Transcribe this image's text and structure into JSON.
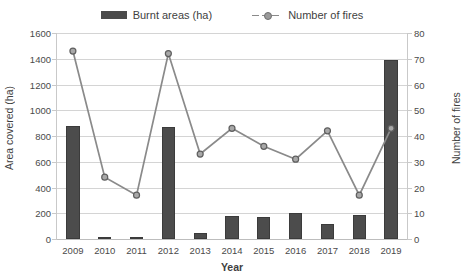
{
  "legend": {
    "items": [
      {
        "label": "Burnt areas (ha)",
        "type": "bar",
        "color": "#4c4c4c",
        "icon": "bar-swatch-icon"
      },
      {
        "label": "Number of fires",
        "type": "line",
        "color": "#8a8a8a",
        "icon": "line-marker-swatch-icon"
      }
    ]
  },
  "axes": {
    "left_title": "Area covered (ha)",
    "right_title": "Number of fires",
    "x_title": "Year",
    "left_ticks": [
      "0",
      "200",
      "400",
      "600",
      "800",
      "1000",
      "1200",
      "1400",
      "1600"
    ],
    "right_ticks": [
      "0",
      "10",
      "20",
      "30",
      "40",
      "50",
      "60",
      "70",
      "80"
    ],
    "x_ticks": [
      "2009",
      "2010",
      "2011",
      "2012",
      "2013",
      "2014",
      "2015",
      "2016",
      "2017",
      "2018",
      "2019"
    ]
  },
  "chart_data": {
    "type": "bar",
    "title": "",
    "subtitle": "",
    "xlabel": "Year",
    "ylabel": "Area covered (ha)",
    "y2label": "Number of fires",
    "categories": [
      "2009",
      "2010",
      "2011",
      "2012",
      "2013",
      "2014",
      "2015",
      "2016",
      "2017",
      "2018",
      "2019"
    ],
    "ylim": [
      0,
      1600
    ],
    "y2lim": [
      0,
      80
    ],
    "ytick_step": 200,
    "y2tick_step": 10,
    "grid": true,
    "legend_position": "top-center",
    "series": [
      {
        "name": "Burnt areas (ha)",
        "type": "bar",
        "axis": "left",
        "color": "#4c4c4c",
        "values": [
          880,
          15,
          15,
          870,
          45,
          180,
          170,
          200,
          120,
          190,
          1390
        ]
      },
      {
        "name": "Number of fires",
        "type": "line",
        "axis": "right",
        "color": "#8a8a8a",
        "marker": "circle",
        "dashed": true,
        "values": [
          73,
          24,
          17,
          72,
          33,
          43,
          36,
          31,
          42,
          17,
          43
        ]
      }
    ]
  }
}
